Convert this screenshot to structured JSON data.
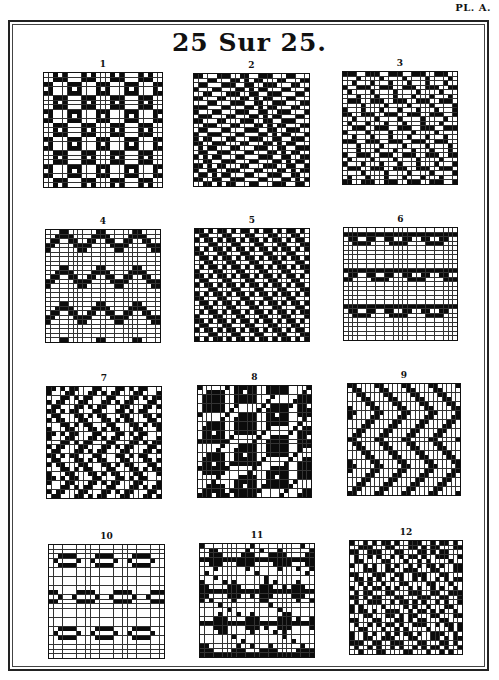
{
  "plate": {
    "label": "PL. A.",
    "title": "25 Sur 25.",
    "grid_size": 25
  },
  "patterns": [
    {
      "number": "1",
      "x": 43,
      "y": 72,
      "w": 120,
      "h": 116,
      "style": "diamond-dots",
      "period": 6
    },
    {
      "number": "2",
      "x": 193,
      "y": 73,
      "w": 117,
      "h": 114,
      "style": "diagonal-steps",
      "period": 5
    },
    {
      "number": "3",
      "x": 342,
      "y": 71,
      "w": 116,
      "h": 114,
      "style": "brick-bars",
      "period": 5
    },
    {
      "number": "4",
      "x": 45,
      "y": 229,
      "w": 116,
      "h": 114,
      "style": "chevron-v",
      "period": 8
    },
    {
      "number": "5",
      "x": 194,
      "y": 228,
      "w": 116,
      "h": 114,
      "style": "twill-diag",
      "period": 5
    },
    {
      "number": "6",
      "x": 343,
      "y": 227,
      "w": 115,
      "h": 114,
      "style": "bird-eye",
      "period": 8
    },
    {
      "number": "7",
      "x": 46,
      "y": 386,
      "w": 116,
      "h": 113,
      "style": "broken-twill",
      "period": 5
    },
    {
      "number": "8",
      "x": 197,
      "y": 385,
      "w": 115,
      "h": 113,
      "style": "ring-blocks",
      "period": 7
    },
    {
      "number": "9",
      "x": 347,
      "y": 383,
      "w": 114,
      "h": 113,
      "style": "zigzag-diag",
      "period": 6
    },
    {
      "number": "10",
      "x": 48,
      "y": 544,
      "w": 117,
      "h": 115,
      "style": "oval-spots",
      "period": 8
    },
    {
      "number": "11",
      "x": 199,
      "y": 543,
      "w": 116,
      "h": 115,
      "style": "star-blocks",
      "period": 7
    },
    {
      "number": "12",
      "x": 349,
      "y": 540,
      "w": 114,
      "h": 115,
      "style": "checker-scatter",
      "period": 5
    }
  ]
}
